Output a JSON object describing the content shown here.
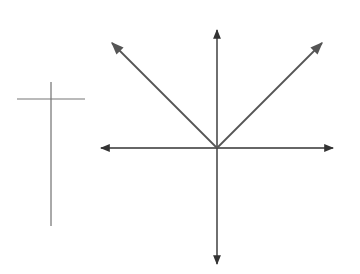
{
  "table": {
    "headers": {
      "x": "x",
      "y": "y"
    },
    "rows": [
      {
        "x": "−4",
        "y": "4"
      },
      {
        "x": "−3",
        "y": "3"
      },
      {
        "x": "−2",
        "y": "2"
      },
      {
        "x": "−1",
        "y": "1"
      },
      {
        "x": "0",
        "y": "0"
      },
      {
        "x": "1",
        "y": "1"
      },
      {
        "x": "2",
        "y": "2"
      },
      {
        "x": "3",
        "y": "3"
      },
      {
        "x": "4",
        "y": "4"
      }
    ]
  },
  "graph": {
    "x_axis_label": "x",
    "y_axis_label": "y",
    "x_tick_labels": [
      "−5",
      "−4",
      "−3",
      "−2",
      "−1",
      "1",
      "2",
      "3",
      "4",
      "5"
    ],
    "y_tick_labels": [
      "5",
      "4",
      "3",
      "2",
      "1",
      "−1",
      "−2",
      "−3",
      "−4",
      "−5"
    ],
    "colors": {
      "grid": "#bbbbbb",
      "axis": "#333333",
      "curve": "#555555"
    }
  },
  "chart_data": {
    "type": "line",
    "title": "",
    "xlabel": "x",
    "ylabel": "y",
    "xlim": [
      -6,
      6
    ],
    "ylim": [
      -6,
      6
    ],
    "grid": true,
    "legend": null,
    "xticks": [
      -5,
      -4,
      -3,
      -2,
      -1,
      1,
      2,
      3,
      4,
      5
    ],
    "yticks": [
      -5,
      -4,
      -3,
      -2,
      -1,
      1,
      2,
      3,
      4,
      5
    ],
    "series": [
      {
        "name": "y = |x|",
        "x": [
          -6,
          -4,
          -3,
          -2,
          -1,
          0,
          1,
          2,
          3,
          4,
          6
        ],
        "y": [
          6,
          4,
          3,
          2,
          1,
          0,
          1,
          2,
          3,
          4,
          6
        ],
        "arrows_at_ends": true
      }
    ],
    "table": {
      "columns": [
        "x",
        "y"
      ],
      "rows": [
        [
          -4,
          4
        ],
        [
          -3,
          3
        ],
        [
          -2,
          2
        ],
        [
          -1,
          1
        ],
        [
          0,
          0
        ],
        [
          1,
          1
        ],
        [
          2,
          2
        ],
        [
          3,
          3
        ],
        [
          4,
          4
        ]
      ]
    }
  }
}
